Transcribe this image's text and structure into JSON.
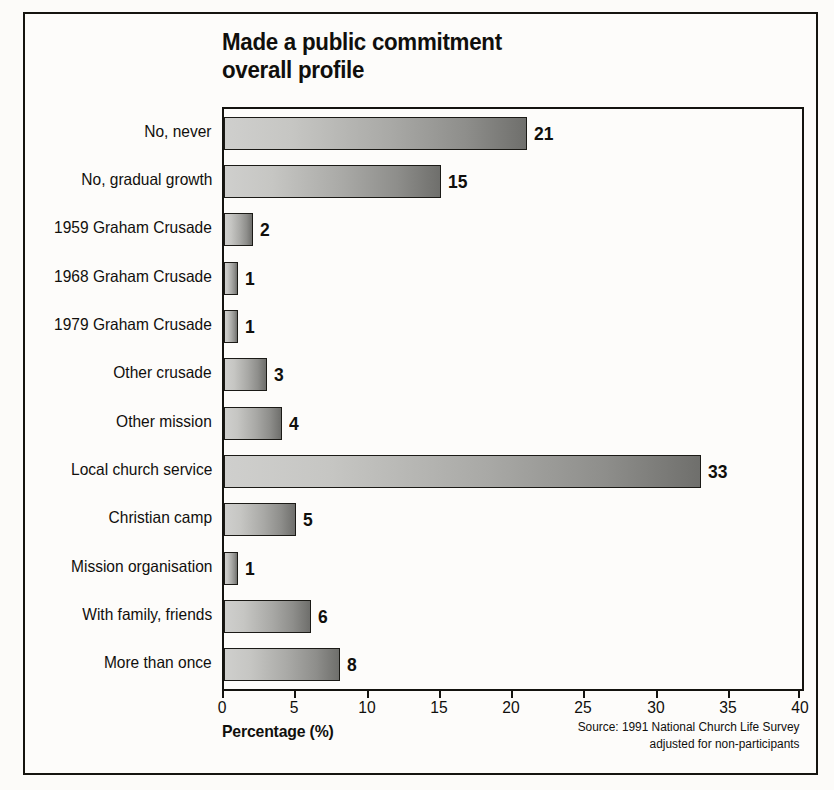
{
  "chart_data": {
    "type": "bar",
    "orientation": "horizontal",
    "title": "Made a public commitment overall profile",
    "title_lines": [
      "Made a public commitment",
      "overall profile"
    ],
    "xlabel": "Percentage (%)",
    "ylabel": "",
    "xlim": [
      0,
      40
    ],
    "xticks": [
      0,
      5,
      10,
      15,
      20,
      25,
      30,
      35,
      40
    ],
    "xtick_labels": [
      "0",
      "5",
      "10",
      "15",
      "20",
      "25",
      "30",
      "35",
      "40"
    ],
    "grid": false,
    "legend": false,
    "categories": [
      "No, never",
      "No, gradual growth",
      "1959 Graham Crusade",
      "1968 Graham Crusade",
      "1979 Graham Crusade",
      "Other crusade",
      "Other mission",
      "Local church service",
      "Christian camp",
      "Mission organisation",
      "With family, friends",
      "More than once"
    ],
    "values": [
      21,
      15,
      2,
      1,
      1,
      3,
      4,
      33,
      5,
      1,
      6,
      8
    ],
    "value_labels": [
      "21",
      "15",
      "2",
      "1",
      "1",
      "3",
      "4",
      "33",
      "5",
      "1",
      "6",
      "8"
    ],
    "bar_gradient": {
      "from": "#cfcfcd",
      "to": "#6f6f6c",
      "border": "#1b1a16"
    },
    "annotations": [
      "Source: 1991 National Church Life Survey",
      "adjusted for non-participants"
    ]
  },
  "source": {
    "line1": "Source: 1991 National Church Life Survey",
    "line2": "adjusted for non-participants"
  },
  "colors": {
    "frame": "#15140f",
    "axis": "#14130f",
    "text": "#100f0c",
    "page_background": "#fcfbf9"
  }
}
